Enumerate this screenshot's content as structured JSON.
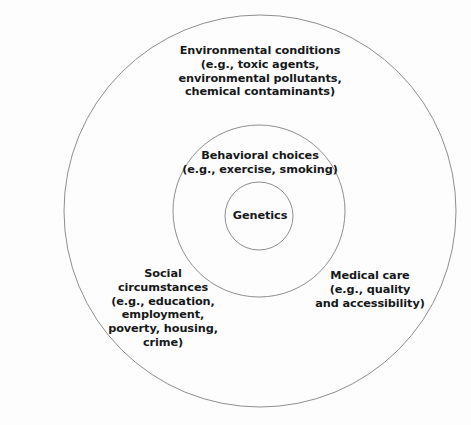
{
  "diagram": {
    "type": "concentric-circles",
    "background_color": "#fdfdfd",
    "stroke_color": "#8c8f93",
    "text_color": "#16181a",
    "rings": [
      {
        "id": "core",
        "name": "Genetics",
        "level": 1,
        "center_x": 259,
        "center_y": 216,
        "radius": 34,
        "label": "Genetics"
      },
      {
        "id": "behavioral",
        "name": "Behavioral choices",
        "level": 2,
        "center_x": 259,
        "center_y": 211,
        "radius": 86,
        "label": "Behavioral choices\n(e.g., exercise, smoking)"
      },
      {
        "id": "outer",
        "name": "Outer determinants ring",
        "level": 3,
        "center_x": 260,
        "center_y": 211,
        "radius": 196,
        "label": ""
      }
    ],
    "labels": {
      "environmental": "Environmental conditions\n(e.g., toxic agents,\nenvironmental pollutants,\nchemical contaminants)",
      "behavioral": "Behavioral choices\n(e.g., exercise, smoking)",
      "genetics": "Genetics",
      "social": "Social\ncircumstances\n(e.g., education,\nemployment,\npoverty, housing,\ncrime)",
      "medical": "Medical care\n(e.g., quality\nand accessibility)"
    }
  }
}
